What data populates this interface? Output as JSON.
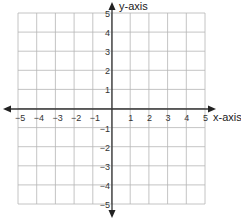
{
  "chart_data": {
    "type": "scatter",
    "title": "",
    "xlabel": "x-axis",
    "ylabel": "y-axis",
    "xlim": [
      -5,
      5
    ],
    "ylim": [
      -5,
      5
    ],
    "grid": true,
    "x_ticks": [
      "-5",
      "-4",
      "-3",
      "-2",
      "-1",
      "1",
      "2",
      "3",
      "4",
      "5"
    ],
    "y_ticks": [
      "5",
      "4",
      "3",
      "2",
      "1",
      "-1",
      "-2",
      "-3",
      "-4",
      "-5"
    ],
    "series": [],
    "colors": {
      "grid": "#b5b5b5",
      "axis": "#333333",
      "text": "#333333"
    }
  }
}
